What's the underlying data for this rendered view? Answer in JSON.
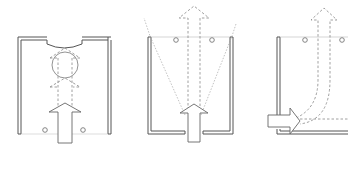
{
  "diagram": {
    "type": "architectural-plan-sketches",
    "background": "#ffffff",
    "line_color": "#666666",
    "panels": [
      {
        "id": "panel-1",
        "description": "Room plan with curved niche at top; arrow enters from bottom, passes through circular element, continues upward with dashed arrowheads",
        "elements": [
          "room-walls",
          "curved-niche",
          "circle",
          "solid-arrow-in",
          "dashed-arrowheads",
          "two-dots"
        ]
      },
      {
        "id": "panel-2",
        "description": "Room plan open at top; arrow enters bottom opening and exits top as dashed arrow; dashed fan lines spread from entry to top corners",
        "elements": [
          "room-walls",
          "solid-arrow-in",
          "dashed-arrow-out",
          "fan-lines",
          "two-dots"
        ]
      },
      {
        "id": "panel-3",
        "description": "Room plan with side entry at bottom-left; arrow enters horizontally and curves upward exiting at top as dashed arrow",
        "elements": [
          "room-walls",
          "solid-arrow-in-side",
          "curved-dashed-arrow-out",
          "horizontal-dashed-line",
          "two-dots"
        ]
      }
    ]
  }
}
